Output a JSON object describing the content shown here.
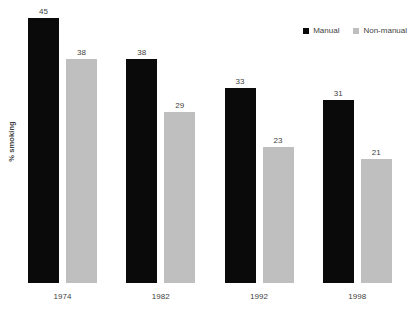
{
  "chart_data": {
    "type": "bar",
    "title": "",
    "subtitle": "",
    "xlabel": "",
    "ylabel": "% smoking",
    "categories": [
      "1974",
      "1982",
      "1992",
      "1998"
    ],
    "series": [
      {
        "name": "Manual",
        "color": "#0a0a0a",
        "values": [
          45,
          38,
          33,
          31
        ]
      },
      {
        "name": "Non-manual",
        "color": "#bfbfbf",
        "values": [
          38,
          29,
          23,
          21
        ]
      }
    ],
    "value_labels": {
      "manual": [
        "45",
        "38",
        "33",
        "31"
      ],
      "non_manual": [
        "38",
        "29",
        "23",
        "21"
      ]
    },
    "ylim": [
      0,
      48
    ],
    "grid": false,
    "legend_position": "top-right",
    "background_color": "#ffffff",
    "text_color": "#3f3f3f"
  },
  "legend": {
    "items": [
      {
        "label": "Manual",
        "swatch_name": "legend-swatch-manual"
      },
      {
        "label": "Non-manual",
        "swatch_name": "legend-swatch-non-manual"
      }
    ]
  },
  "axis": {
    "y_title": "% smoking",
    "x_ticks": [
      "1974",
      "1982",
      "1992",
      "1998"
    ]
  }
}
